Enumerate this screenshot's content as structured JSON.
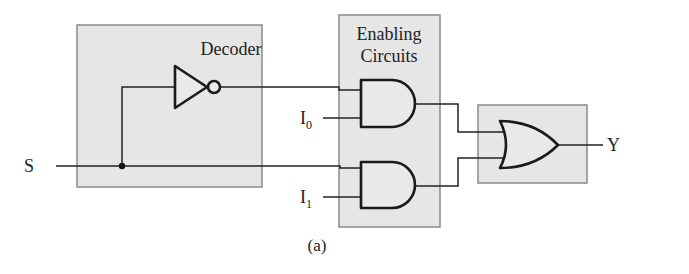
{
  "diagram": {
    "caption": "(a)",
    "blocks": {
      "decoder": {
        "title": "Decoder"
      },
      "enabling": {
        "title_line1": "Enabling",
        "title_line2": "Circuits"
      },
      "or_stage": {
        "title": ""
      }
    },
    "signals": {
      "select": "S",
      "input0_base": "I",
      "input0_sub": "0",
      "input1_base": "I",
      "input1_sub": "1",
      "output": "Y"
    },
    "gates": [
      {
        "type": "NOT",
        "block": "decoder",
        "input": "S",
        "output": "S'"
      },
      {
        "type": "AND",
        "block": "enabling",
        "inputs": [
          "S'",
          "I0"
        ]
      },
      {
        "type": "AND",
        "block": "enabling",
        "inputs": [
          "S",
          "I1"
        ]
      },
      {
        "type": "OR",
        "block": "or_stage",
        "inputs": [
          "AND0",
          "AND1"
        ],
        "output": "Y"
      }
    ],
    "colors": {
      "block_fill": "#e6e6e6",
      "block_border": "#8a8a8a",
      "wire": "#222222"
    }
  }
}
